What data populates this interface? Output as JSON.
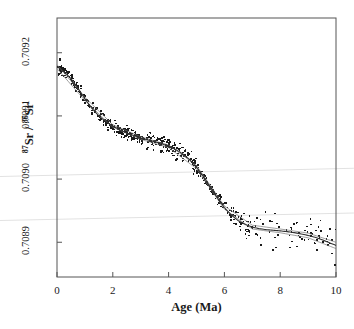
{
  "figure": {
    "axis_title_x": "Age (Ma)",
    "axis_title_y_prefix": "Sr / ",
    "axis_title_y_sup1": "87",
    "axis_title_y_sup2": "86",
    "axis_title_y_suffix": "Sr",
    "axis_title_y_plain": "87Sr / 86Sr"
  },
  "chart_data": {
    "type": "scatter",
    "title": "",
    "xlabel": "Age (Ma)",
    "ylabel": "87Sr / 86Sr",
    "xlim": [
      0,
      10
    ],
    "ylim": [
      0.708845,
      0.709255
    ],
    "xticks": [
      0,
      2,
      4,
      6,
      8,
      10
    ],
    "xtick_labels": [
      "0",
      "2",
      "4",
      "6",
      "8",
      "10"
    ],
    "yticks": [
      0.7089,
      0.709,
      0.7091,
      0.7092
    ],
    "ytick_labels": [
      "0.7089",
      "0.7090",
      "0.7091",
      "0.7092"
    ],
    "grid": false,
    "legend": null,
    "marker_color": "#1a1a1a",
    "marker_size": 1.6,
    "fit_line_color": "#333333",
    "fit_envelope_color": "#777777",
    "frame_color": "#555555",
    "artifact_line_color": "#e2e2e2",
    "series": [
      {
        "name": "fit",
        "type": "line",
        "x": [
          0.0,
          0.25,
          0.5,
          0.75,
          1.0,
          1.25,
          1.5,
          1.75,
          2.0,
          2.25,
          2.5,
          2.75,
          3.0,
          3.25,
          3.5,
          3.75,
          4.0,
          4.25,
          4.5,
          4.75,
          5.0,
          5.25,
          5.5,
          5.75,
          6.0,
          6.25,
          6.5,
          6.75,
          7.0,
          7.25,
          7.5,
          7.75,
          8.0,
          8.25,
          8.5,
          8.75,
          9.0,
          9.25,
          9.5,
          9.75,
          10.0
        ],
        "y": [
          0.709178,
          0.70917,
          0.709159,
          0.709144,
          0.709127,
          0.709112,
          0.7091,
          0.709091,
          0.709084,
          0.709078,
          0.709073,
          0.709069,
          0.709065,
          0.709062,
          0.709059,
          0.709056,
          0.709052,
          0.709047,
          0.70904,
          0.709031,
          0.709019,
          0.709004,
          0.708987,
          0.70897,
          0.708955,
          0.708943,
          0.708934,
          0.708928,
          0.708924,
          0.7089215,
          0.70892,
          0.708919,
          0.708918,
          0.7089168,
          0.7089152,
          0.7089132,
          0.7089108,
          0.7089078,
          0.708904,
          0.7088995,
          0.708895
        ]
      },
      {
        "name": "confidence_envelope_upper",
        "type": "line",
        "x": [
          0.0,
          1.0,
          2.0,
          3.0,
          4.0,
          5.0,
          6.0,
          7.0,
          8.0,
          9.0,
          10.0
        ],
        "y": [
          0.709181,
          0.7091295,
          0.709086,
          0.709067,
          0.709054,
          0.7090215,
          0.7089575,
          0.708927,
          0.708921,
          0.7089145,
          0.7089
        ]
      },
      {
        "name": "confidence_envelope_lower",
        "type": "line",
        "x": [
          0.0,
          1.0,
          2.0,
          3.0,
          4.0,
          5.0,
          6.0,
          7.0,
          8.0,
          9.0,
          10.0
        ],
        "y": [
          0.709175,
          0.7091245,
          0.709082,
          0.709063,
          0.70905,
          0.7090165,
          0.7089525,
          0.708921,
          0.708915,
          0.7089071,
          0.70889
        ]
      },
      {
        "name": "measurements",
        "type": "scatter",
        "n_points": 620,
        "note": "individual foraminiferal Sr isotope analyses, scatter increases markedly beyond 7 Ma"
      }
    ]
  }
}
